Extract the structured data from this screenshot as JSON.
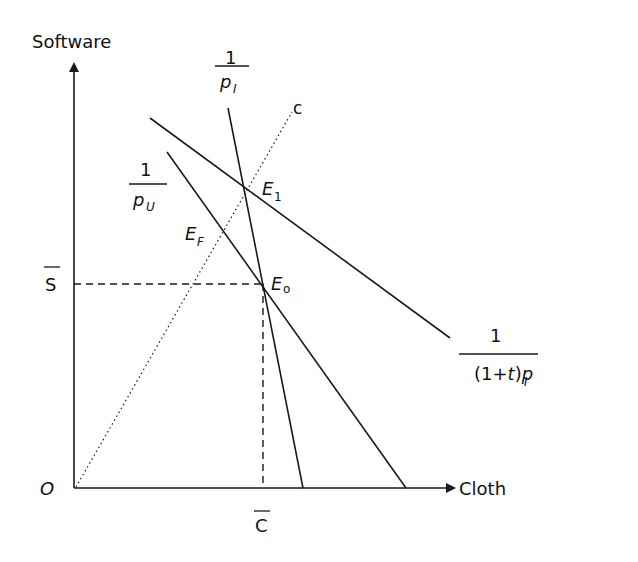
{
  "diagram": {
    "axes": {
      "y_label": "Software",
      "x_label": "Cloth",
      "origin_label": "O"
    },
    "levels": {
      "s_bar": "S",
      "c_bar": "C"
    },
    "lines": {
      "steep": {
        "num": "1",
        "den_p": "p",
        "den_sub": "I"
      },
      "pu": {
        "num": "1",
        "den_p": "p",
        "den_sub": "U"
      },
      "tax": {
        "num": "1",
        "den_prefix": "(1+",
        "den_t": "t",
        "den_suffix": ")",
        "den_p": "p",
        "den_sub": "I"
      },
      "c_ray": "c"
    },
    "points": {
      "e1": {
        "main": "E",
        "sub": "1"
      },
      "ef": {
        "main": "E",
        "sub": "F"
      },
      "e0": {
        "main": "E",
        "sub": "o"
      }
    },
    "colors": {
      "ink": "#1a1a1a",
      "background": "#ffffff"
    }
  }
}
